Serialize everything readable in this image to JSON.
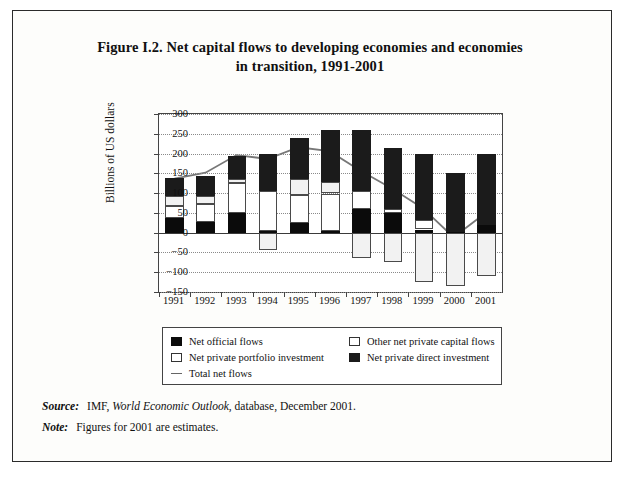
{
  "figure": {
    "title_line1": "Figure I.2.  Net capital flows to developing economies and economies",
    "title_line2": "in transition, 1991-2001"
  },
  "footnotes": {
    "source_label": "Source:",
    "source_pre": "IMF,",
    "source_italic": "World Economic Outlook",
    "source_post": ", database, December 2001.",
    "note_label": "Note:",
    "note_text": "Figures for 2001 are estimates."
  },
  "legend": {
    "items": [
      {
        "key": "official",
        "label": "Net official flows",
        "marker": "filled-square-swatch"
      },
      {
        "key": "other",
        "label": "Other net private capital flows",
        "marker": "open-square-swatch"
      },
      {
        "key": "portfolio",
        "label": "Net private portfolio investment",
        "marker": "open-square-swatch"
      },
      {
        "key": "direct",
        "label": "Net private direct investment",
        "marker": "filled-square-swatch"
      },
      {
        "key": "total",
        "label": "Total net flows",
        "marker": "line-swatch"
      }
    ]
  },
  "chart_data": {
    "type": "bar",
    "subtype": "stacked-bar-with-line-overlay",
    "title": "Net capital flows to developing economies and economies in transition, 1991-2001",
    "xlabel": "",
    "ylabel": "Billions of US dollars",
    "categories": [
      "1991",
      "1992",
      "1993",
      "1994",
      "1995",
      "1996",
      "1997",
      "1998",
      "1999",
      "2000",
      "2001"
    ],
    "ylim": [
      -150,
      300
    ],
    "yticks": [
      300,
      250,
      200,
      150,
      100,
      50,
      0,
      -50,
      -100,
      -150
    ],
    "ytick_labels": [
      "300",
      "250",
      "200",
      "150",
      "100",
      "50",
      "0",
      "-50",
      "-100",
      "-150"
    ],
    "grid": true,
    "legend_position": "below-plot",
    "series": [
      {
        "name": "Net official flows",
        "key": "official",
        "color": "#0b0b0b",
        "values": [
          38,
          28,
          50,
          5,
          25,
          4,
          60,
          50,
          8,
          2,
          20
        ]
      },
      {
        "name": "Net private portfolio investment",
        "key": "portfolio",
        "color": "#ffffff",
        "values": [
          30,
          45,
          75,
          100,
          70,
          95,
          45,
          10,
          25,
          0,
          0
        ]
      },
      {
        "name": "Other net private capital flows",
        "key": "other",
        "color": "#f2f2f2",
        "values": [
          25,
          20,
          10,
          -45,
          40,
          30,
          -65,
          -75,
          -125,
          -135,
          -110
        ]
      },
      {
        "name": "Net private direct investment",
        "key": "direct",
        "color": "#1b1b1b",
        "values": [
          45,
          50,
          60,
          95,
          105,
          130,
          155,
          155,
          165,
          150,
          180
        ]
      },
      {
        "name": "Total net flows",
        "key": "total",
        "color": "#777777",
        "type": "line",
        "values": [
          135,
          150,
          195,
          185,
          215,
          205,
          155,
          110,
          60,
          -15,
          45
        ]
      }
    ],
    "annotations": []
  }
}
